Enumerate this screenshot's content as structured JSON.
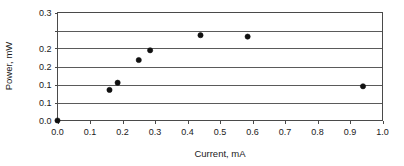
{
  "chart_data": {
    "type": "scatter",
    "title": "",
    "xlabel": "Current, mA",
    "ylabel": "Power, mW",
    "xlim": [
      0.0,
      1.0
    ],
    "ylim": [
      0.0,
      0.3
    ],
    "grid": true,
    "grid_axis": "y",
    "legend": false,
    "marker": "filled-circle",
    "marker_color": "#111111",
    "frame_color": "#4a4a4a",
    "xticks": [
      0.0,
      0.1,
      0.2,
      0.3,
      0.4,
      0.5,
      0.6,
      0.7,
      0.8,
      0.9,
      1.0
    ],
    "xticklabels": [
      "0.0",
      "0.1",
      "0.2",
      "0.3",
      "0.4",
      "0.5",
      "0.6",
      "0.7",
      "0.8",
      "0.9",
      "1.0"
    ],
    "yticks": [
      0.0,
      0.05,
      0.1,
      0.15,
      0.2,
      0.25,
      0.3
    ],
    "yticklabels": [
      "0.0",
      "0.1",
      "0.1",
      "0.2",
      "0.2",
      "0.3"
    ],
    "ytick_values_labeled": [
      0.0,
      0.05,
      0.1,
      0.15,
      0.2,
      0.25,
      0.3
    ],
    "series": [
      {
        "name": "Power vs Current",
        "x": [
          0.0,
          0.16,
          0.185,
          0.25,
          0.285,
          0.44,
          0.585,
          0.94
        ],
        "y": [
          0.0,
          0.085,
          0.105,
          0.168,
          0.195,
          0.237,
          0.233,
          0.095
        ]
      }
    ]
  },
  "axes": {
    "x_title": "Current, mA",
    "y_title": "Power, mW"
  }
}
